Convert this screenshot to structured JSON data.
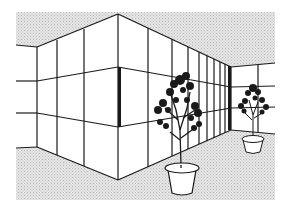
{
  "illustration": {
    "caption": "Line drawing of an interior room corner with paneled walls and two potted plants",
    "colors": {
      "background": "#ffffff",
      "shade": "#d9d9d9",
      "line": "#1a1a1a",
      "pot": "#ffffff"
    },
    "objects": [
      "ceiling",
      "left-wall",
      "right-wall",
      "back-wall",
      "floor",
      "large-potted-plant",
      "small-potted-plant"
    ]
  }
}
